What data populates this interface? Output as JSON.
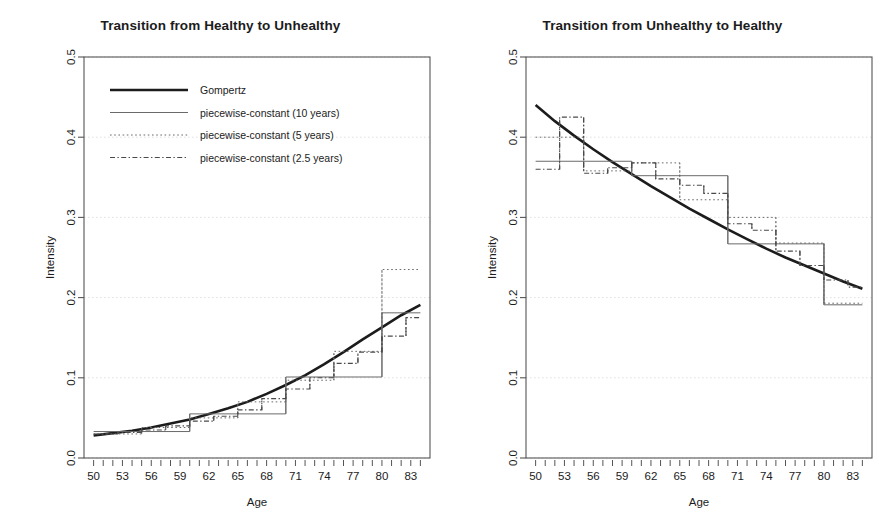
{
  "figure": {
    "background": "#ffffff",
    "foreground": "#1c1c1c",
    "grid_color": "#d8d8d8"
  },
  "panels": [
    {
      "id": "healthy-to-unhealthy",
      "title": "Transition from Healthy to Unhealthy",
      "xlabel": "Age",
      "ylabel": "Intensity",
      "show_legend": true
    },
    {
      "id": "unhealthy-to-healthy",
      "title": "Transition from Unhealthy to Healthy",
      "xlabel": "Age",
      "ylabel": "Intensity",
      "show_legend": false
    }
  ],
  "legend": {
    "items": [
      {
        "label": "Gompertz",
        "style": "solid-thick",
        "color": "#1c1c1c"
      },
      {
        "label": "piecewise-constant (10 years)",
        "style": "solid-thin",
        "color": "#555555"
      },
      {
        "label": "piecewise-constant (5 years)",
        "style": "dotted",
        "color": "#555555"
      },
      {
        "label": "piecewise-constant (2.5 years)",
        "style": "dashdot",
        "color": "#444444"
      }
    ]
  },
  "axes": {
    "x_ticks_labeled": [
      50,
      53,
      56,
      59,
      62,
      65,
      68,
      71,
      74,
      77,
      80,
      83
    ],
    "x_ticks_minor_step": 1,
    "xlim": [
      49,
      85
    ],
    "y_ticks_labeled": [
      "0.0",
      "0.1",
      "0.2",
      "0.3",
      "0.4",
      "0.5"
    ],
    "ylim": [
      0.0,
      0.5
    ],
    "grid": true
  },
  "chart_data": [
    {
      "type": "line",
      "id": "healthy-to-unhealthy",
      "title": "Transition from Healthy to Unhealthy",
      "xlabel": "Age",
      "ylabel": "Intensity",
      "xlim": [
        49,
        85
      ],
      "ylim": [
        0.0,
        0.5
      ],
      "grid": true,
      "legend_position": "top-left",
      "series": [
        {
          "name": "Gompertz",
          "style": "solid-thick",
          "x": [
            50,
            52,
            54,
            56,
            58,
            60,
            62,
            64,
            66,
            68,
            70,
            72,
            74,
            76,
            78,
            80,
            82,
            84
          ],
          "y": [
            0.028,
            0.031,
            0.034,
            0.038,
            0.043,
            0.048,
            0.055,
            0.062,
            0.07,
            0.08,
            0.091,
            0.103,
            0.117,
            0.132,
            0.148,
            0.163,
            0.178,
            0.191
          ]
        },
        {
          "name": "piecewise-constant (10 years)",
          "style": "solid-thin",
          "step_edges": [
            50,
            60,
            70,
            80,
            84
          ],
          "step_values": [
            0.033,
            0.055,
            0.101,
            0.181
          ]
        },
        {
          "name": "piecewise-constant (5 years)",
          "style": "dotted",
          "step_edges": [
            50,
            55,
            60,
            65,
            70,
            75,
            80,
            84
          ],
          "step_values": [
            0.03,
            0.038,
            0.05,
            0.07,
            0.097,
            0.133,
            0.235
          ]
        },
        {
          "name": "piecewise-constant (2.5 years)",
          "style": "dashdot",
          "step_edges": [
            50,
            52.5,
            55,
            57.5,
            60,
            62.5,
            65,
            67.5,
            70,
            72.5,
            75,
            77.5,
            80,
            82.5,
            84
          ],
          "step_values": [
            0.03,
            0.032,
            0.035,
            0.04,
            0.046,
            0.052,
            0.06,
            0.074,
            0.086,
            0.1,
            0.118,
            0.132,
            0.152,
            0.175
          ]
        }
      ]
    },
    {
      "type": "line",
      "id": "unhealthy-to-healthy",
      "title": "Transition from Unhealthy to Healthy",
      "xlabel": "Age",
      "ylabel": "Intensity",
      "xlim": [
        49,
        85
      ],
      "ylim": [
        0.0,
        0.5
      ],
      "grid": true,
      "legend_position": "none",
      "series": [
        {
          "name": "Gompertz",
          "style": "solid-thick",
          "x": [
            50,
            52,
            54,
            56,
            58,
            60,
            62,
            64,
            66,
            68,
            70,
            72,
            74,
            76,
            78,
            80,
            82,
            84
          ],
          "y": [
            0.44,
            0.42,
            0.402,
            0.385,
            0.369,
            0.354,
            0.339,
            0.325,
            0.311,
            0.298,
            0.285,
            0.273,
            0.261,
            0.25,
            0.24,
            0.23,
            0.22,
            0.211
          ]
        },
        {
          "name": "piecewise-constant (10 years)",
          "style": "solid-thin",
          "step_edges": [
            50,
            60,
            70,
            80,
            84
          ],
          "step_values": [
            0.37,
            0.352,
            0.267,
            0.191
          ]
        },
        {
          "name": "piecewise-constant (5 years)",
          "style": "dotted",
          "step_edges": [
            50,
            55,
            60,
            65,
            70,
            75,
            80,
            84
          ],
          "step_values": [
            0.4,
            0.358,
            0.368,
            0.322,
            0.3,
            0.268,
            0.193
          ]
        },
        {
          "name": "piecewise-constant (2.5 years)",
          "style": "dashdot",
          "step_edges": [
            50,
            52.5,
            55,
            57.5,
            60,
            62.5,
            65,
            67.5,
            70,
            72.5,
            75,
            77.5,
            80,
            82.5,
            84
          ],
          "step_values": [
            0.36,
            0.425,
            0.355,
            0.362,
            0.368,
            0.348,
            0.34,
            0.33,
            0.292,
            0.284,
            0.258,
            0.24,
            0.222,
            0.213
          ]
        }
      ]
    }
  ]
}
